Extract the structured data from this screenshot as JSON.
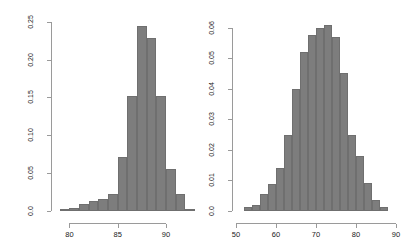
{
  "figure": {
    "title": "",
    "background": "#ffffff",
    "bar_color": "#7d7d7d",
    "axis_color": "#9a9a9a",
    "panels": 2
  },
  "chart_data": [
    {
      "type": "bar",
      "name": "left-histogram",
      "title": "",
      "xlabel": "",
      "ylabel": "",
      "grid": false,
      "legend": false,
      "bin_width": 1,
      "xlim": [
        78.5,
        92.5
      ],
      "ylim": [
        0,
        0.255
      ],
      "xticks": [
        80,
        85,
        90
      ],
      "xtick_labels": [
        "80",
        "85",
        "90"
      ],
      "yticks": [
        0.0,
        0.05,
        0.1,
        0.15,
        0.2,
        0.25
      ],
      "ytick_labels": [
        "0.0",
        "0.05",
        "0.10",
        "0.15",
        "0.20",
        "0.25"
      ],
      "bins": [
        {
          "x0": 79,
          "x1": 80,
          "center": 79.5,
          "value": 0.002
        },
        {
          "x0": 80,
          "x1": 81,
          "center": 80.5,
          "value": 0.004
        },
        {
          "x0": 81,
          "x1": 82,
          "center": 81.5,
          "value": 0.009
        },
        {
          "x0": 82,
          "x1": 83,
          "center": 82.5,
          "value": 0.013
        },
        {
          "x0": 83,
          "x1": 84,
          "center": 83.5,
          "value": 0.016
        },
        {
          "x0": 84,
          "x1": 85,
          "center": 84.5,
          "value": 0.022
        },
        {
          "x0": 85,
          "x1": 86,
          "center": 85.5,
          "value": 0.072
        },
        {
          "x0": 86,
          "x1": 87,
          "center": 86.5,
          "value": 0.152
        },
        {
          "x0": 87,
          "x1": 88,
          "center": 87.5,
          "value": 0.245
        },
        {
          "x0": 88,
          "x1": 89,
          "center": 88.5,
          "value": 0.228
        },
        {
          "x0": 89,
          "x1": 90,
          "center": 89.5,
          "value": 0.152
        },
        {
          "x0": 90,
          "x1": 91,
          "center": 90.5,
          "value": 0.055
        },
        {
          "x0": 91,
          "x1": 92,
          "center": 91.5,
          "value": 0.023
        },
        {
          "x0": 92,
          "x1": 93,
          "center": 92.5,
          "value": 0.002
        }
      ]
    },
    {
      "type": "bar",
      "name": "right-histogram",
      "title": "",
      "xlabel": "",
      "ylabel": "",
      "grid": false,
      "legend": false,
      "bin_width": 2,
      "xlim": [
        50,
        90
      ],
      "ylim": [
        0,
        0.0625
      ],
      "xticks": [
        50,
        60,
        70,
        80,
        90
      ],
      "xtick_labels": [
        "50",
        "60",
        "70",
        "80",
        "90"
      ],
      "yticks": [
        0.0,
        0.01,
        0.02,
        0.03,
        0.04,
        0.05,
        0.06
      ],
      "ytick_labels": [
        "0.0",
        "0.01",
        "0.02",
        "0.03",
        "0.04",
        "0.05",
        "0.06"
      ],
      "bins": [
        {
          "x0": 52,
          "x1": 54,
          "center": 53,
          "value": 0.0012
        },
        {
          "x0": 54,
          "x1": 56,
          "center": 55,
          "value": 0.002
        },
        {
          "x0": 56,
          "x1": 58,
          "center": 57,
          "value": 0.0055
        },
        {
          "x0": 58,
          "x1": 60,
          "center": 59,
          "value": 0.009
        },
        {
          "x0": 60,
          "x1": 62,
          "center": 61,
          "value": 0.014
        },
        {
          "x0": 62,
          "x1": 64,
          "center": 63,
          "value": 0.025
        },
        {
          "x0": 64,
          "x1": 66,
          "center": 65,
          "value": 0.04
        },
        {
          "x0": 66,
          "x1": 68,
          "center": 67,
          "value": 0.052
        },
        {
          "x0": 68,
          "x1": 70,
          "center": 69,
          "value": 0.0575
        },
        {
          "x0": 70,
          "x1": 72,
          "center": 71,
          "value": 0.06
        },
        {
          "x0": 72,
          "x1": 74,
          "center": 73,
          "value": 0.061
        },
        {
          "x0": 74,
          "x1": 76,
          "center": 75,
          "value": 0.057
        },
        {
          "x0": 76,
          "x1": 78,
          "center": 77,
          "value": 0.045
        },
        {
          "x0": 78,
          "x1": 80,
          "center": 79,
          "value": 0.025
        },
        {
          "x0": 80,
          "x1": 82,
          "center": 81,
          "value": 0.018
        },
        {
          "x0": 82,
          "x1": 84,
          "center": 83,
          "value": 0.0092
        },
        {
          "x0": 84,
          "x1": 86,
          "center": 85,
          "value": 0.0035
        },
        {
          "x0": 86,
          "x1": 88,
          "center": 87,
          "value": 0.0012
        }
      ]
    }
  ]
}
